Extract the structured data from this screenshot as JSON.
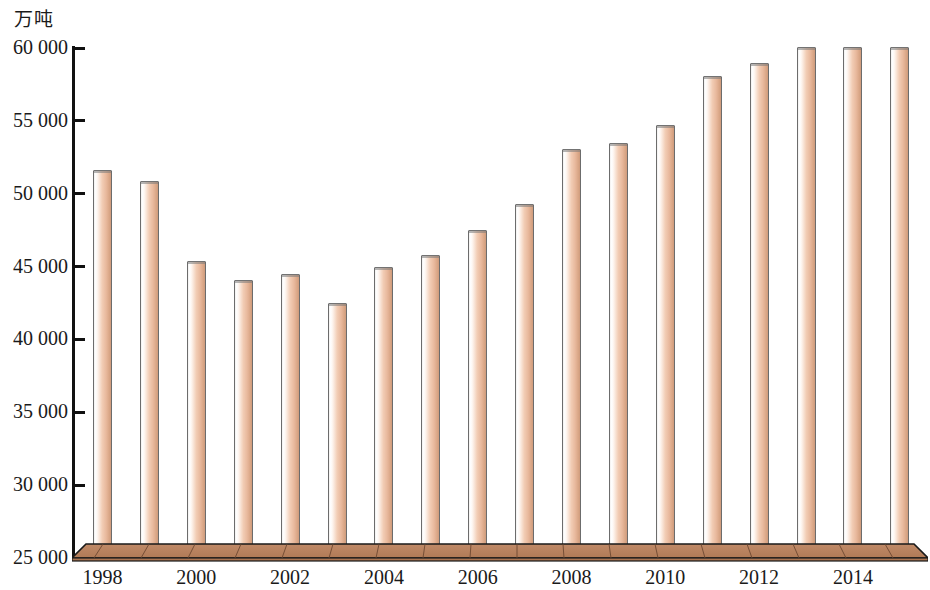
{
  "chart_data": {
    "type": "bar",
    "title": "",
    "subtitle": "",
    "unit_label": "万吨",
    "xlabel": "",
    "ylabel": "万吨",
    "ylim": [
      25000,
      60000
    ],
    "y_ticks": [
      "25 000",
      "30 000",
      "35 000",
      "40 000",
      "45 000",
      "50 000",
      "55 000",
      "60 000"
    ],
    "y_tick_values": [
      25000,
      30000,
      35000,
      40000,
      45000,
      50000,
      55000,
      60000
    ],
    "grid": false,
    "legend": "none",
    "x_tick_labels": [
      "1998",
      "2000",
      "2002",
      "2004",
      "2006",
      "2008",
      "2010",
      "2012",
      "2014"
    ],
    "categories": [
      "1998",
      "1999",
      "2000",
      "2001",
      "2002",
      "2003",
      "2004",
      "2005",
      "2006",
      "2007",
      "2008",
      "2009",
      "2010",
      "2011",
      "2012",
      "2013",
      "2014",
      "2015"
    ],
    "values": [
      51600,
      50900,
      45400,
      44100,
      44500,
      42500,
      45000,
      45800,
      47500,
      49300,
      53100,
      53500,
      54700,
      58100,
      59000,
      60100,
      60100,
      60100
    ],
    "series": [
      {
        "name": "产量",
        "values": [
          51600,
          50900,
          45400,
          44100,
          44500,
          42500,
          45000,
          45800,
          47500,
          49300,
          53100,
          53500,
          54700,
          58100,
          59000,
          60100,
          60100,
          60100
        ]
      }
    ],
    "colors": {
      "bar_fill_light": "#ffffff",
      "bar_fill_mid": "#f2cdb5",
      "bar_fill_dark": "#cf9b7c",
      "bar_outline": "#6c6c6c",
      "ground_top": "#c79170",
      "ground_front": "#a9704c",
      "axis": "#111111",
      "background": "#ffffff"
    }
  }
}
